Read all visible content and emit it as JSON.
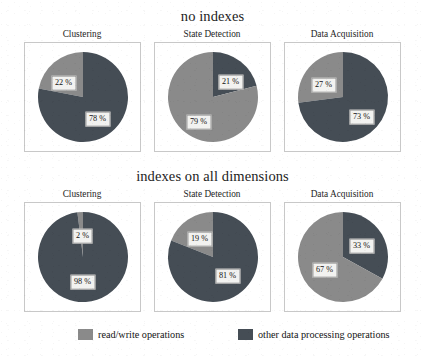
{
  "figure": {
    "background_color": "#ffffff",
    "panel_border_color": "#c8c8c8"
  },
  "colors": {
    "read_write": "#8a8a8a",
    "other_processing": "#454d55",
    "label_box_fill": "#f2f2f0",
    "label_box_border": "#9a9a9a"
  },
  "groups": [
    {
      "title": "no indexes"
    },
    {
      "title": "indexes on all dimensions"
    }
  ],
  "legend": {
    "entries": [
      {
        "label": "read/write operations",
        "color": "#8a8a8a"
      },
      {
        "label": "other data processing operations",
        "color": "#454d55"
      }
    ]
  },
  "chart_data": {
    "type": "pie",
    "legend_position": "bottom",
    "series_names": [
      "read/write operations",
      "other data processing operations"
    ],
    "colors": [
      "#8a8a8a",
      "#454d55"
    ],
    "value_suffix": "%",
    "groups": [
      {
        "name": "no indexes",
        "charts": [
          {
            "title": "Clustering",
            "labels": [
              "read/write operations",
              "other data processing operations"
            ],
            "values": [
              22,
              78
            ],
            "value_labels": [
              "22 %",
              "78 %"
            ],
            "slices": [
              {
                "series": "read/write operations",
                "value": 22,
                "label": "22 %",
                "color": "#8a8a8a",
                "start_deg": 280.8,
                "end_deg": 360.0,
                "label_x": 34,
                "label_y": 39
              },
              {
                "series": "other data processing operations",
                "value": 78,
                "label": "78 %",
                "color": "#454d55",
                "start_deg": 0.0,
                "end_deg": 280.8,
                "label_x": 68,
                "label_y": 75
              }
            ]
          },
          {
            "title": "State Detection",
            "labels": [
              "read/write operations",
              "other data processing operations"
            ],
            "values": [
              79,
              21
            ],
            "value_labels": [
              "79 %",
              "21 %"
            ],
            "slices": [
              {
                "series": "other data processing operations",
                "value": 21,
                "label": "21 %",
                "color": "#454d55",
                "start_deg": 0.0,
                "end_deg": 75.6,
                "label_x": 71,
                "label_y": 38
              },
              {
                "series": "read/write operations",
                "value": 79,
                "label": "79 %",
                "color": "#8a8a8a",
                "start_deg": 75.6,
                "end_deg": 360.0,
                "label_x": 39,
                "label_y": 78
              }
            ]
          },
          {
            "title": "Data Acquisition",
            "labels": [
              "read/write operations",
              "other data processing operations"
            ],
            "values": [
              27,
              73
            ],
            "value_labels": [
              "27 %",
              "73 %"
            ],
            "slices": [
              {
                "series": "read/write operations",
                "value": 27,
                "label": "27 %",
                "color": "#8a8a8a",
                "start_deg": 262.8,
                "end_deg": 360.0,
                "label_x": 34,
                "label_y": 41
              },
              {
                "series": "other data processing operations",
                "value": 73,
                "label": "73 %",
                "color": "#454d55",
                "start_deg": 0.0,
                "end_deg": 262.8,
                "label_x": 72,
                "label_y": 73
              }
            ]
          }
        ]
      },
      {
        "name": "indexes on all dimensions",
        "charts": [
          {
            "title": "Clustering",
            "labels": [
              "read/write operations",
              "other data processing operations"
            ],
            "values": [
              2,
              98
            ],
            "value_labels": [
              "2 %",
              "98 %"
            ],
            "slices": [
              {
                "series": "read/write operations",
                "value": 2,
                "label": "2 %",
                "color": "#8a8a8a",
                "start_deg": 352.8,
                "end_deg": 360.0,
                "label_x": 53,
                "label_y": 32
              },
              {
                "series": "other data processing operations",
                "value": 98,
                "label": "98 %",
                "color": "#454d55",
                "start_deg": 0.0,
                "end_deg": 352.8,
                "label_x": 53,
                "label_y": 78
              }
            ]
          },
          {
            "title": "State Detection",
            "labels": [
              "read/write operations",
              "other data processing operations"
            ],
            "values": [
              19,
              81
            ],
            "value_labels": [
              "19 %",
              "81 %"
            ],
            "slices": [
              {
                "series": "read/write operations",
                "value": 19,
                "label": "19 %",
                "color": "#8a8a8a",
                "start_deg": 291.6,
                "end_deg": 360.0,
                "label_x": 40,
                "label_y": 35
              },
              {
                "series": "other data processing operations",
                "value": 81,
                "label": "81 %",
                "color": "#454d55",
                "start_deg": 0.0,
                "end_deg": 291.6,
                "label_x": 68,
                "label_y": 72
              }
            ]
          },
          {
            "title": "Data Acquisition",
            "labels": [
              "read/write operations",
              "other data processing operations"
            ],
            "values": [
              67,
              33
            ],
            "value_labels": [
              "67 %",
              "33 %"
            ],
            "slices": [
              {
                "series": "other data processing operations",
                "value": 33,
                "label": "33 %",
                "color": "#454d55",
                "start_deg": 0.0,
                "end_deg": 118.8,
                "label_x": 72,
                "label_y": 42
              },
              {
                "series": "read/write operations",
                "value": 67,
                "label": "67 %",
                "color": "#8a8a8a",
                "start_deg": 118.8,
                "end_deg": 360.0,
                "label_x": 35,
                "label_y": 66
              }
            ]
          }
        ]
      }
    ]
  }
}
